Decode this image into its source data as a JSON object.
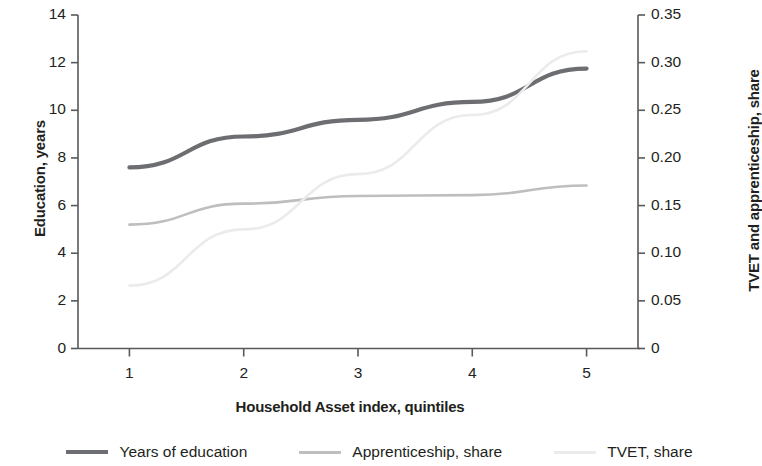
{
  "chart_data": {
    "type": "line",
    "title": "",
    "xlabel": "Household Asset index, quintiles",
    "ylabel": "Education, years",
    "y2label": "TVET and apprenticeship, share",
    "categories": [
      "1",
      "2",
      "3",
      "4",
      "5"
    ],
    "x": [
      1,
      2,
      3,
      4,
      5
    ],
    "xlim": [
      0.55,
      5.45
    ],
    "ylim": [
      0,
      14
    ],
    "y2lim": [
      0,
      0.35
    ],
    "yticks": [
      "0",
      "2",
      "4",
      "6",
      "8",
      "10",
      "12",
      "14"
    ],
    "ytick_values": [
      0,
      2,
      4,
      6,
      8,
      10,
      12,
      14
    ],
    "y2ticks": [
      "0",
      "0.05",
      "0.10",
      "0.15",
      "0.20",
      "0.25",
      "0.30",
      "0.35"
    ],
    "y2tick_values": [
      0,
      0.05,
      0.1,
      0.15,
      0.2,
      0.25,
      0.3,
      0.35
    ],
    "xticks": [
      "1",
      "2",
      "3",
      "4",
      "5"
    ],
    "grid": false,
    "legend_position": "bottom",
    "series": [
      {
        "name": "Years of education",
        "axis": "left",
        "color": "#6d6e71",
        "width": 4.2,
        "values": [
          7.6,
          8.9,
          9.6,
          10.35,
          11.75
        ]
      },
      {
        "name": "Apprenticeship, share",
        "axis": "right",
        "color": "#bcbec0",
        "width": 2.6,
        "values": [
          0.13,
          0.152,
          0.16,
          0.161,
          0.171
        ]
      },
      {
        "name": "TVET, share",
        "axis": "right",
        "color": "#ebebec",
        "width": 2.6,
        "values": [
          0.066,
          0.125,
          0.183,
          0.245,
          0.312
        ]
      }
    ]
  },
  "legend": {
    "items": [
      {
        "label": "Years of education",
        "color": "#6d6e71",
        "thickness": "4px"
      },
      {
        "label": "Apprenticeship, share",
        "color": "#bcbec0",
        "thickness": "3px"
      },
      {
        "label": "TVET, share",
        "color": "#ebebec",
        "thickness": "3px"
      }
    ]
  },
  "axes": {
    "left_title": "Education, years",
    "right_title": "TVET and apprenticeship, share",
    "x_title": "Household Asset index, quintiles"
  }
}
